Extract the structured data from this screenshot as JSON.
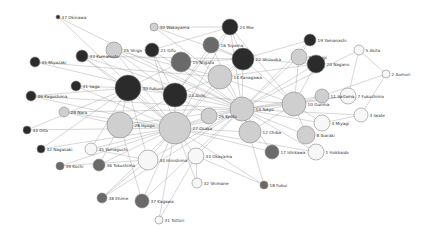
{
  "colors": {
    "dark": "#2b2b2b",
    "mid": "#6a6a6a",
    "light": "#cfcfcf",
    "white": "#f7f7f7",
    "edge": "#8a8a8a",
    "label": "#333333"
  },
  "graph": {
    "nodes": [
      {
        "id": 1,
        "label": "1 Hokkaido",
        "x": 316,
        "y": 152,
        "r": 8,
        "shade": "white"
      },
      {
        "id": 2,
        "label": "2 Aomori",
        "x": 386,
        "y": 74,
        "r": 4,
        "shade": "white"
      },
      {
        "id": 3,
        "label": "3 Iwate",
        "x": 361,
        "y": 115,
        "r": 7,
        "shade": "white"
      },
      {
        "id": 4,
        "label": "4 Miyagi",
        "x": 322,
        "y": 123,
        "r": 8,
        "shade": "white"
      },
      {
        "id": 5,
        "label": "5 Akita",
        "x": 359,
        "y": 50,
        "r": 5,
        "shade": "white"
      },
      {
        "id": 7,
        "label": "7 Fukushima",
        "x": 348,
        "y": 96,
        "r": 8,
        "shade": "white"
      },
      {
        "id": 8,
        "label": "8 Ibaraki",
        "x": 306,
        "y": 135,
        "r": 9,
        "shade": "light"
      },
      {
        "id": 9,
        "label": "9 Tochigi",
        "x": 299,
        "y": 57,
        "r": 8,
        "shade": "light"
      },
      {
        "id": 10,
        "label": "10 Gunma",
        "x": 294,
        "y": 104,
        "r": 12,
        "shade": "light"
      },
      {
        "id": 11,
        "label": "11 Saitama",
        "x": 322,
        "y": 96,
        "r": 7,
        "shade": "light"
      },
      {
        "id": 12,
        "label": "12 Chiba",
        "x": 250,
        "y": 132,
        "r": 11,
        "shade": "light"
      },
      {
        "id": 13,
        "label": "13 Tokyo",
        "x": 242,
        "y": 109,
        "r": 12,
        "shade": "light"
      },
      {
        "id": 14,
        "label": "14 Kanagawa",
        "x": 220,
        "y": 77,
        "r": 12,
        "shade": "light"
      },
      {
        "id": 15,
        "label": "15 Niigata",
        "x": 181,
        "y": 62,
        "r": 10,
        "shade": "mid"
      },
      {
        "id": 16,
        "label": "16 Toyama",
        "x": 211,
        "y": 45,
        "r": 8,
        "shade": "mid"
      },
      {
        "id": 17,
        "label": "17 Ishikawa",
        "x": 272,
        "y": 152,
        "r": 7,
        "shade": "mid"
      },
      {
        "id": 18,
        "label": "18 Fukui",
        "x": 264,
        "y": 185,
        "r": 4,
        "shade": "mid"
      },
      {
        "id": 19,
        "label": "19 Yamanashi",
        "x": 310,
        "y": 40,
        "r": 6,
        "shade": "dark"
      },
      {
        "id": 20,
        "label": "20 Nagano",
        "x": 316,
        "y": 64,
        "r": 9,
        "shade": "dark"
      },
      {
        "id": 21,
        "label": "21 Gifu",
        "x": 152,
        "y": 50,
        "r": 7,
        "shade": "dark"
      },
      {
        "id": 22,
        "label": "22 Shizuoka",
        "x": 243,
        "y": 59,
        "r": 11,
        "shade": "dark"
      },
      {
        "id": 23,
        "label": "23 Aichi",
        "x": 175,
        "y": 95,
        "r": 12,
        "shade": "dark"
      },
      {
        "id": 24,
        "label": "24 Mie",
        "x": 230,
        "y": 27,
        "r": 8,
        "shade": "dark"
      },
      {
        "id": 25,
        "label": "25 Shiga",
        "x": 114,
        "y": 50,
        "r": 8,
        "shade": "light"
      },
      {
        "id": 26,
        "label": "26 Kyoto",
        "x": 209,
        "y": 116,
        "r": 8,
        "shade": "light"
      },
      {
        "id": 27,
        "label": "27 Osaka",
        "x": 175,
        "y": 128,
        "r": 16,
        "shade": "light"
      },
      {
        "id": 28,
        "label": "28 Hyogo",
        "x": 120,
        "y": 125,
        "r": 13,
        "shade": "light"
      },
      {
        "id": 29,
        "label": "29 Nara",
        "x": 64,
        "y": 112,
        "r": 5,
        "shade": "light"
      },
      {
        "id": 30,
        "label": "30 Wakayama",
        "x": 154,
        "y": 27,
        "r": 4,
        "shade": "light"
      },
      {
        "id": 31,
        "label": "31 Tottori",
        "x": 159,
        "y": 220,
        "r": 4,
        "shade": "white"
      },
      {
        "id": 32,
        "label": "32 Shimane",
        "x": 197,
        "y": 183,
        "r": 5,
        "shade": "white"
      },
      {
        "id": 33,
        "label": "33 Okayama",
        "x": 196,
        "y": 156,
        "r": 8,
        "shade": "white"
      },
      {
        "id": 34,
        "label": "34 Hiroshima",
        "x": 148,
        "y": 160,
        "r": 10,
        "shade": "white"
      },
      {
        "id": 35,
        "label": "35 Yamaguchi",
        "x": 91,
        "y": 149,
        "r": 6,
        "shade": "white"
      },
      {
        "id": 36,
        "label": "36 Tokushima",
        "x": 99,
        "y": 165,
        "r": 6,
        "shade": "mid"
      },
      {
        "id": 37,
        "label": "37 Kagawa",
        "x": 142,
        "y": 201,
        "r": 7,
        "shade": "mid"
      },
      {
        "id": 38,
        "label": "38 Ehime",
        "x": 102,
        "y": 198,
        "r": 5,
        "shade": "mid"
      },
      {
        "id": 39,
        "label": "39 Kochi",
        "x": 60,
        "y": 166,
        "r": 4,
        "shade": "mid"
      },
      {
        "id": 40,
        "label": "40 Fukuoka",
        "x": 128,
        "y": 88,
        "r": 13,
        "shade": "dark"
      },
      {
        "id": 41,
        "label": "41 Saga",
        "x": 76,
        "y": 86,
        "r": 5,
        "shade": "dark"
      },
      {
        "id": 42,
        "label": "42 Nagasaki",
        "x": 41,
        "y": 149,
        "r": 4,
        "shade": "dark"
      },
      {
        "id": 43,
        "label": "43 Kumamoto",
        "x": 82,
        "y": 56,
        "r": 6,
        "shade": "dark"
      },
      {
        "id": 44,
        "label": "44 Oita",
        "x": 27,
        "y": 130,
        "r": 4,
        "shade": "dark"
      },
      {
        "id": 45,
        "label": "45 Miyazaki",
        "x": 35,
        "y": 62,
        "r": 5,
        "shade": "dark"
      },
      {
        "id": 46,
        "label": "46 Kagoshima",
        "x": 31,
        "y": 96,
        "r": 5,
        "shade": "dark"
      },
      {
        "id": 47,
        "label": "47 Okinawa",
        "x": 58,
        "y": 17,
        "r": 2,
        "shade": "dark"
      }
    ],
    "edges": [
      [
        47,
        27
      ],
      [
        47,
        13
      ],
      [
        45,
        14
      ],
      [
        45,
        23
      ],
      [
        43,
        27
      ],
      [
        43,
        13
      ],
      [
        43,
        22
      ],
      [
        43,
        40
      ],
      [
        25,
        27
      ],
      [
        25,
        13
      ],
      [
        25,
        23
      ],
      [
        25,
        14
      ],
      [
        30,
        14
      ],
      [
        30,
        22
      ],
      [
        30,
        24
      ],
      [
        21,
        23
      ],
      [
        21,
        13
      ],
      [
        21,
        27
      ],
      [
        21,
        24
      ],
      [
        24,
        13
      ],
      [
        24,
        23
      ],
      [
        24,
        27
      ],
      [
        24,
        10
      ],
      [
        24,
        22
      ],
      [
        16,
        13
      ],
      [
        16,
        23
      ],
      [
        16,
        22
      ],
      [
        15,
        13
      ],
      [
        15,
        22
      ],
      [
        15,
        40
      ],
      [
        22,
        13
      ],
      [
        22,
        27
      ],
      [
        22,
        10
      ],
      [
        22,
        14
      ],
      [
        19,
        13
      ],
      [
        19,
        9
      ],
      [
        19,
        22
      ],
      [
        20,
        13
      ],
      [
        20,
        10
      ],
      [
        20,
        22
      ],
      [
        20,
        14
      ],
      [
        9,
        13
      ],
      [
        9,
        10
      ],
      [
        5,
        13
      ],
      [
        5,
        7
      ],
      [
        5,
        2
      ],
      [
        2,
        3
      ],
      [
        2,
        11
      ],
      [
        7,
        13
      ],
      [
        7,
        10
      ],
      [
        3,
        13
      ],
      [
        3,
        4
      ],
      [
        11,
        13
      ],
      [
        11,
        10
      ],
      [
        4,
        13
      ],
      [
        4,
        10
      ],
      [
        8,
        13
      ],
      [
        8,
        10
      ],
      [
        1,
        13
      ],
      [
        1,
        27
      ],
      [
        17,
        13
      ],
      [
        17,
        27
      ],
      [
        18,
        27
      ],
      [
        18,
        13
      ],
      [
        18,
        33
      ],
      [
        12,
        13
      ],
      [
        12,
        27
      ],
      [
        12,
        10
      ],
      [
        13,
        27
      ],
      [
        13,
        23
      ],
      [
        13,
        14
      ],
      [
        13,
        10
      ],
      [
        14,
        27
      ],
      [
        14,
        23
      ],
      [
        14,
        10
      ],
      [
        10,
        27
      ],
      [
        10,
        23
      ],
      [
        23,
        27
      ],
      [
        23,
        40
      ],
      [
        26,
        27
      ],
      [
        26,
        13
      ],
      [
        26,
        23
      ],
      [
        27,
        28
      ],
      [
        27,
        40
      ],
      [
        28,
        40
      ],
      [
        28,
        13
      ],
      [
        28,
        23
      ],
      [
        29,
        27
      ],
      [
        29,
        28
      ],
      [
        29,
        13
      ],
      [
        41,
        40
      ],
      [
        41,
        27
      ],
      [
        46,
        40
      ],
      [
        46,
        27
      ],
      [
        46,
        13
      ],
      [
        44,
        40
      ],
      [
        44,
        27
      ],
      [
        42,
        40
      ],
      [
        42,
        27
      ],
      [
        35,
        27
      ],
      [
        35,
        40
      ],
      [
        35,
        34
      ],
      [
        39,
        27
      ],
      [
        39,
        34
      ],
      [
        36,
        27
      ],
      [
        36,
        28
      ],
      [
        38,
        27
      ],
      [
        38,
        34
      ],
      [
        38,
        13
      ],
      [
        37,
        27
      ],
      [
        37,
        28
      ],
      [
        37,
        13
      ],
      [
        31,
        27
      ],
      [
        31,
        33
      ],
      [
        32,
        27
      ],
      [
        32,
        33
      ],
      [
        33,
        27
      ],
      [
        33,
        13
      ],
      [
        34,
        27
      ],
      [
        34,
        13
      ],
      [
        34,
        40
      ],
      [
        6,
        13
      ]
    ]
  }
}
